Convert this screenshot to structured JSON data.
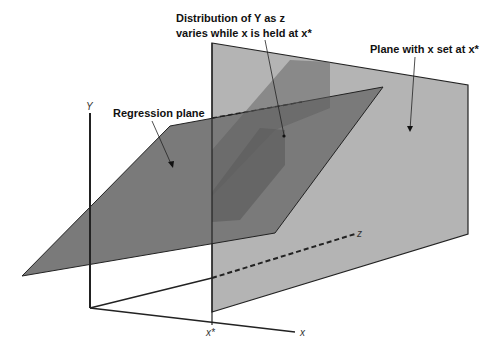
{
  "labels": {
    "distribution_line1": "Distribution of Y as z",
    "distribution_line2": "varies while x is held at x*",
    "plane_x": "Plane with x set at x*",
    "regression_plane": "Regression plane"
  },
  "axes": {
    "y": "Y",
    "x": "x",
    "z": "z",
    "x_star": "x*"
  },
  "colors": {
    "vertical_plane": "#b4b4b4",
    "regression_plane": "#7a7a7a",
    "intersection_band": "#5a5a5a",
    "lines": "#222222"
  }
}
